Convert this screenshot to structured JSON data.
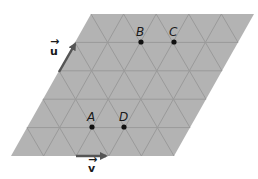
{
  "diagram": {
    "type": "triangular-lattice-parallelogram",
    "rows": 5,
    "cols": 5,
    "colors": {
      "fill": "#b3b3b3",
      "grid_line": "#999999",
      "point": "#111111",
      "arrow": "#555555",
      "text": "#1a1a1a"
    },
    "points": [
      {
        "label": "A",
        "row": 4,
        "col": 1
      },
      {
        "label": "B",
        "row": 1,
        "col": 2
      },
      {
        "label": "C",
        "row": 1,
        "col": 3
      },
      {
        "label": "D",
        "row": 4,
        "col": 2
      }
    ],
    "vectors": [
      {
        "label": "u",
        "display": "u⃗",
        "direction": "along left edge (60°)"
      },
      {
        "label": "v",
        "display": "v⃗",
        "direction": "along bottom edge (horizontal)"
      }
    ]
  },
  "labels": {
    "A": "A",
    "B": "B",
    "C": "C",
    "D": "D",
    "u": "u",
    "v": "v"
  }
}
